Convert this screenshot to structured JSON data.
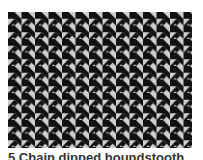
{
  "image": {
    "pattern": "houndstooth",
    "colors": {
      "dark": "#111111",
      "light": "#cfcfcf"
    }
  },
  "caption": {
    "text": "5 Chain dipped houndstooth"
  }
}
